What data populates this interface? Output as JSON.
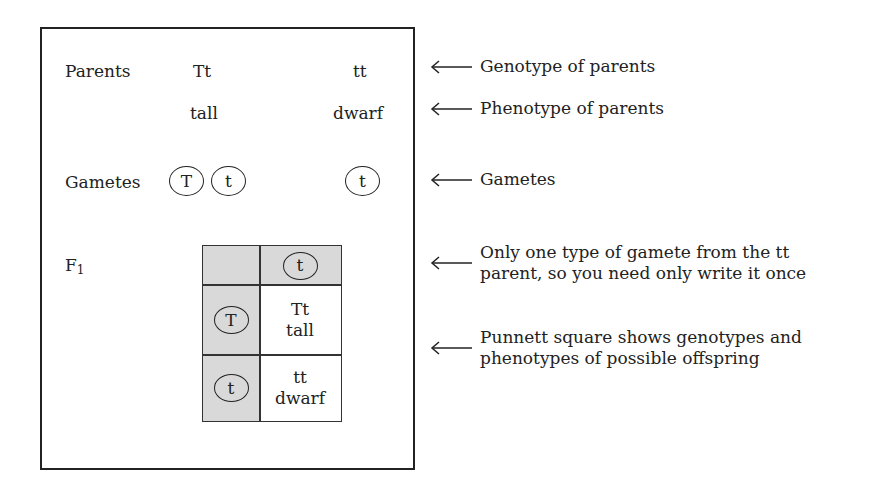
{
  "diagram": {
    "rows": {
      "parents": {
        "label": "Parents",
        "left_genotype": "Tt",
        "right_genotype": "tt",
        "left_phenotype": "tall",
        "right_phenotype": "dwarf"
      },
      "gametes": {
        "label": "Gametes",
        "left_gametes": [
          "T",
          "t"
        ],
        "right_gametes": [
          "t"
        ]
      },
      "f1": {
        "label": "F",
        "label_subscript": "1"
      }
    },
    "punnett_square": {
      "column_header": "t",
      "row_headers": [
        "T",
        "t"
      ],
      "cells": [
        {
          "genotype": "Tt",
          "phenotype": "tall"
        },
        {
          "genotype": "tt",
          "phenotype": "dwarf"
        }
      ],
      "header_fill": "#d9d9d9"
    },
    "annotations": [
      {
        "lines": [
          "Genotype of parents"
        ]
      },
      {
        "lines": [
          "Phenotype of parents"
        ]
      },
      {
        "lines": [
          "Gametes"
        ]
      },
      {
        "lines": [
          "Only one type of gamete from the tt",
          "parent, so you need only write it once"
        ]
      },
      {
        "lines": [
          "Punnett square shows genotypes and",
          "phenotypes of possible offspring"
        ]
      }
    ],
    "icons": {
      "annotation_arrow": "left-arrow-icon",
      "gamete_marker": "circle-outline"
    }
  }
}
